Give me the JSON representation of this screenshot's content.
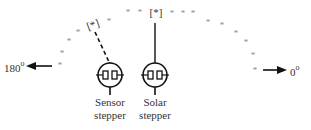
{
  "diagram": {
    "left_angle": {
      "value": "180",
      "unit": "o"
    },
    "right_angle": {
      "value": "0",
      "unit": "o"
    },
    "sensor_position_marker": "[*]",
    "solar_position_marker": "[*]",
    "arc_marker": "*",
    "sensor_label": [
      "Sensor",
      "stepper"
    ],
    "solar_label": [
      "Solar",
      "stepper"
    ],
    "arc_points": [
      [
        60,
        65
      ],
      [
        62,
        53
      ],
      [
        69,
        41
      ],
      [
        78,
        32
      ],
      [
        109,
        21
      ],
      [
        128,
        12
      ],
      [
        140,
        12
      ],
      [
        172,
        13
      ],
      [
        183,
        13
      ],
      [
        193,
        13
      ],
      [
        208,
        22
      ],
      [
        222,
        25
      ],
      [
        236,
        33
      ],
      [
        246,
        42
      ],
      [
        253,
        55
      ],
      [
        255,
        70
      ]
    ],
    "colors": {
      "line": "#111111",
      "star": "#888888",
      "text": "#333333"
    }
  }
}
